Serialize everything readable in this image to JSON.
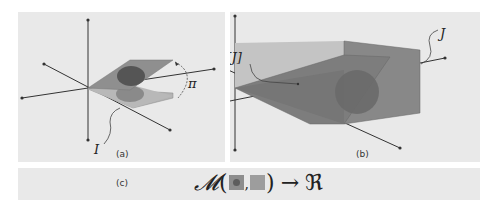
{
  "panels": {
    "a": {
      "caption": "(a)",
      "labels": {
        "pi": "π",
        "I": "I"
      }
    },
    "b": {
      "caption": "(b)",
      "labels": {
        "pi_J": "π[J]",
        "J": "J"
      }
    },
    "c": {
      "caption": "(c)",
      "formula": {
        "operator": "𝓜",
        "open": "(",
        "comma": ",",
        "close": ")",
        "arrow": "→",
        "codomain": "ℜ"
      }
    }
  },
  "colors": {
    "panel_bg": "#e9e9e9",
    "plane_fill": "#8f8f8f",
    "plane_light": "#b8b8b8",
    "ellipse_dark": "#555555",
    "box_fill": "#7d7d7d",
    "axis": "#333333"
  }
}
